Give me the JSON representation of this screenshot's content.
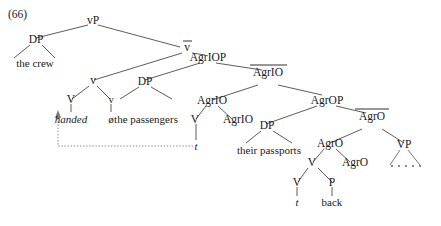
{
  "figure": {
    "example_number": "(66)",
    "type": "syntax-tree",
    "background_color": "#ffffff",
    "line_color": "#4a4a4a",
    "text_color": "#1a1a1a",
    "trace_color": "#7a7a7a"
  },
  "nodes": {
    "vp": "vP",
    "dp_subject": "DP",
    "vbar": "v",
    "v_upper": "v",
    "v_cap": "V",
    "v_little": "v",
    "agriop": "AgrIOP",
    "agriobar": "AgrIO",
    "dp_io": "DP",
    "agrio_mid": "AgrIO",
    "v_agrio": "V",
    "agrio_low": "AgrIO",
    "agrop": "AgrOP",
    "agrobar": "AgrO",
    "dp_obj": "DP",
    "agro_mid": "AgrO",
    "v_agro": "V",
    "agro_low": "AgrO",
    "v_bottom": "V",
    "p_bottom": "P",
    "vp_right": "VP"
  },
  "terminals": {
    "subject": "the crew",
    "verb": "handed",
    "null_morpheme": "ø",
    "indirect_object": "the passengers",
    "trace_1": "t",
    "direct_object": "their passports",
    "trace_2": "t",
    "particle": "back",
    "ellipsis": ". . . . ."
  },
  "annotations": {
    "overbar_nodes": [
      "vbar",
      "agriobar",
      "agrobar"
    ],
    "movement_arrow": "verb-raising-trace-to-handed"
  }
}
